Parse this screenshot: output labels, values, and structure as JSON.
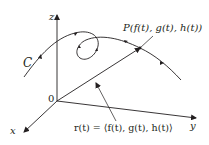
{
  "diagram": {
    "axes": {
      "z_label": "z",
      "y_label": "y",
      "x_label": "x",
      "origin_label": "0"
    },
    "curve_label": "C",
    "point_label": "P(f(t), g(t), h(t))",
    "vector_label": "r(t) = ⟨f(t), g(t), h(t)⟩",
    "colors": {
      "stroke": "#231f20",
      "background": "#ffffff"
    }
  }
}
